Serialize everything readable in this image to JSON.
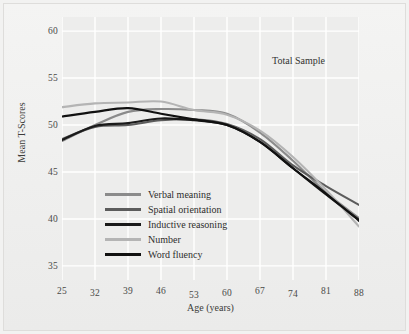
{
  "figure": {
    "annotation": "Total Sample",
    "background_color": "#ededec",
    "grid_color": "#ffffff"
  },
  "chart_data": {
    "type": "line",
    "title": "",
    "annotation": "Total Sample",
    "xlabel": "Age (years)",
    "ylabel": "Mean T-Scores",
    "x": [
      25,
      32,
      39,
      46,
      53,
      60,
      67,
      74,
      81,
      88
    ],
    "xticklabels": [
      "25",
      "32",
      "39",
      "46",
      "53",
      "60",
      "67",
      "74",
      "81",
      "88"
    ],
    "yticks": [
      35,
      40,
      45,
      50,
      55,
      60
    ],
    "yticklabels": [
      "35",
      "40",
      "45",
      "50",
      "55",
      "60"
    ],
    "xlim": [
      25,
      88
    ],
    "ylim": [
      33.5,
      61.5
    ],
    "grid": true,
    "legend_position": "lower-left-inside",
    "series": [
      {
        "name": "Verbal meaning",
        "color": "#8b8b8b",
        "values": [
          48.3,
          50.0,
          51.4,
          51.7,
          51.6,
          51.2,
          49.2,
          46.2,
          42.8,
          40.1
        ]
      },
      {
        "name": "Spatial orientation",
        "color": "#5c5c5c",
        "values": [
          48.5,
          49.8,
          50.0,
          50.5,
          50.6,
          50.1,
          48.5,
          45.7,
          43.5,
          41.5
        ]
      },
      {
        "name": "Inductive reasoning",
        "color": "#1a1a1a",
        "values": [
          48.4,
          49.9,
          50.2,
          50.7,
          50.5,
          50.0,
          48.2,
          45.4,
          42.6,
          39.9
        ]
      },
      {
        "name": "Number",
        "color": "#b4b4b4",
        "values": [
          51.9,
          52.3,
          52.4,
          52.5,
          51.6,
          51.1,
          49.4,
          46.6,
          43.1,
          39.2
        ]
      },
      {
        "name": "Word fluency",
        "color": "#111111",
        "values": [
          50.9,
          51.4,
          51.8,
          51.2,
          50.6,
          50.0,
          48.2,
          45.4,
          42.7,
          39.8
        ]
      }
    ]
  }
}
